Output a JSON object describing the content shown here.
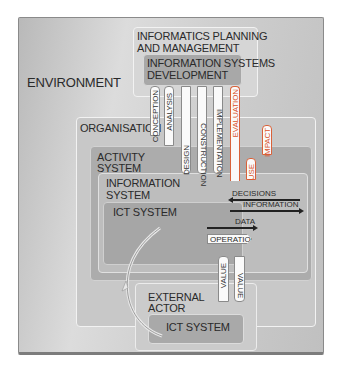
{
  "diagram": {
    "environment": {
      "label": "ENVIRONMENT"
    },
    "informatics_planning": {
      "label_line1": "INFORMATICS PLANNING",
      "label_line2": "AND MANAGEMENT"
    },
    "is_development": {
      "label_line1": "INFORMATION SYSTEMS",
      "label_line2": "DEVELOPMENT"
    },
    "organisation": {
      "label": "ORGANISATION"
    },
    "activity_system": {
      "label_line1": "ACTIVITY",
      "label_line2": "SYSTEM"
    },
    "information_system": {
      "label_line1": "INFORMATION",
      "label_line2": "SYSTEM"
    },
    "ict_system": {
      "label": "ICT SYSTEM"
    },
    "external_actor": {
      "label_line1": "EXTERNAL",
      "label_line2": "ACTOR"
    },
    "external_ict_system": {
      "label": "ICT SYSTEM"
    },
    "phases": {
      "conception": "CONCEPTION",
      "analysis": "ANALYSIS",
      "design": "DESIGN",
      "construction": "CONSTRUCTION",
      "implementation": "IMPLEMENTATION",
      "evaluation": "EVALUATION",
      "use": "USE",
      "impact": "IMPACT"
    },
    "flows": {
      "decisions": "DECISIONS",
      "information": "INFORMATION",
      "data": "DATA",
      "operation": "OPERATION",
      "value_up": "VALUE",
      "value_down": "VALUE"
    },
    "colors": {
      "highlight": "#d9532a",
      "background": "#c8c8c8"
    }
  }
}
